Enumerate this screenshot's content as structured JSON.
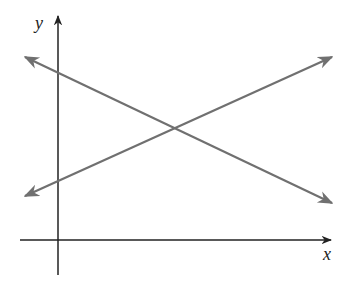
{
  "diagram": {
    "type": "coordinate-plane-two-intersecting-lines",
    "axes": {
      "x_label": "x",
      "y_label": "y",
      "color": "#222222"
    },
    "lines": [
      {
        "name": "decreasing-line",
        "description": "line with negative slope, arrows both ends",
        "color": "#707070",
        "start": [
          25,
          57
        ],
        "end": [
          332,
          203
        ]
      },
      {
        "name": "increasing-line",
        "description": "line with positive slope, arrows both ends",
        "color": "#707070",
        "start": [
          25,
          196
        ],
        "end": [
          332,
          57
        ]
      }
    ],
    "intersection": {
      "note": "lines intersect in first quadrant",
      "point": [
        175,
        127
      ]
    }
  }
}
